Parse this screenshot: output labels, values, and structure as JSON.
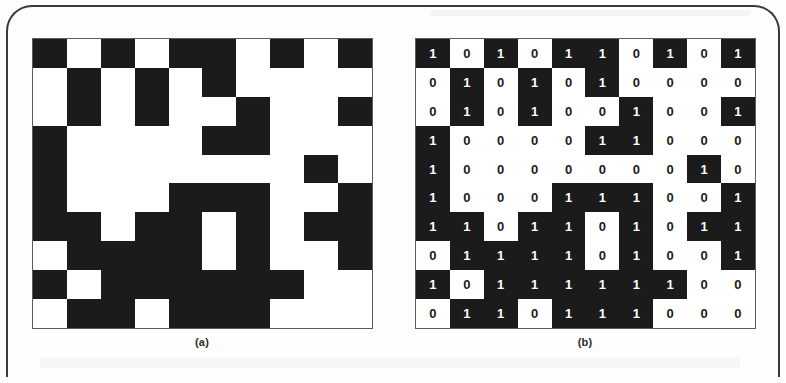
{
  "figure": {
    "panels": [
      {
        "id": "a",
        "caption": "(a)",
        "render_mode": "blocks",
        "description": "Black and white block representation of the binary matrix"
      },
      {
        "id": "b",
        "caption": "(b)",
        "render_mode": "digits",
        "description": "Same matrix with the 0 and 1 values printed in each cell"
      }
    ]
  },
  "colors": {
    "one_background": "#1b1b1b",
    "one_text": "#ffffff",
    "zero_background": "#ffffff",
    "zero_text": "#1b1b1b",
    "grid_border": "#5c5c5c",
    "scan_border": "#3a3a3a",
    "page_background": "#fdfdfc"
  },
  "labels": {
    "one": "1",
    "zero": "0"
  },
  "chart_data": {
    "type": "heatmap",
    "title": "",
    "xlabel": "",
    "ylabel": "",
    "rows": 10,
    "cols": 10,
    "legend": [
      {
        "value": 1,
        "label": "1",
        "color": "#1b1b1b"
      },
      {
        "value": 0,
        "label": "0",
        "color": "#ffffff"
      }
    ],
    "matrix": [
      [
        1,
        0,
        1,
        0,
        1,
        1,
        0,
        1,
        0,
        1
      ],
      [
        0,
        1,
        0,
        1,
        0,
        1,
        0,
        0,
        0,
        0
      ],
      [
        0,
        1,
        0,
        1,
        0,
        0,
        1,
        0,
        0,
        1
      ],
      [
        1,
        0,
        0,
        0,
        0,
        1,
        1,
        0,
        0,
        0
      ],
      [
        1,
        0,
        0,
        0,
        0,
        0,
        0,
        0,
        1,
        0
      ],
      [
        1,
        0,
        0,
        0,
        1,
        1,
        1,
        0,
        0,
        1
      ],
      [
        1,
        1,
        0,
        1,
        1,
        0,
        1,
        0,
        1,
        1
      ],
      [
        0,
        1,
        1,
        1,
        1,
        0,
        1,
        0,
        0,
        1
      ],
      [
        1,
        0,
        1,
        1,
        1,
        1,
        1,
        1,
        0,
        0
      ],
      [
        0,
        1,
        1,
        0,
        1,
        1,
        1,
        0,
        0,
        0
      ]
    ]
  }
}
